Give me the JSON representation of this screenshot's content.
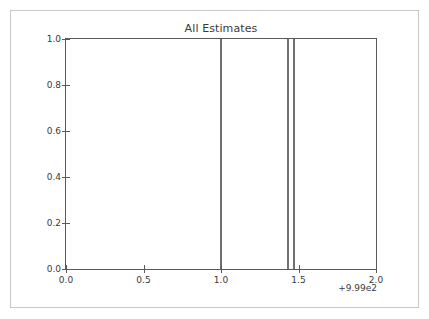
{
  "figure": {
    "background_color": "#ffffff",
    "frame_color": "#c9c9c9"
  },
  "chart_data": {
    "type": "line",
    "title": "All Estimates",
    "xlabel": "",
    "ylabel": "",
    "xlim": [
      0.0,
      2.0
    ],
    "ylim": [
      0.0,
      1.0
    ],
    "grid": false,
    "legend": null,
    "x_offset_label": "+9.99e2",
    "x_tick_labels": [
      "0.0",
      "0.5",
      "1.0",
      "1.5",
      "2.0"
    ],
    "x_tick_values": [
      0.0,
      0.5,
      1.0,
      1.5,
      2.0
    ],
    "y_tick_labels": [
      "0.0",
      "0.2",
      "0.4",
      "0.6",
      "0.8",
      "1.0"
    ],
    "y_tick_values": [
      0.0,
      0.2,
      0.4,
      0.6,
      0.8,
      1.0
    ],
    "series": [
      {
        "name": "estimate-lines",
        "kind": "vertical-lines",
        "color": "#707070",
        "linewidth": 2,
        "ymin": 0.0,
        "ymax": 1.0,
        "x": [
          1.0,
          1.43,
          1.47
        ]
      }
    ],
    "annotations": []
  }
}
